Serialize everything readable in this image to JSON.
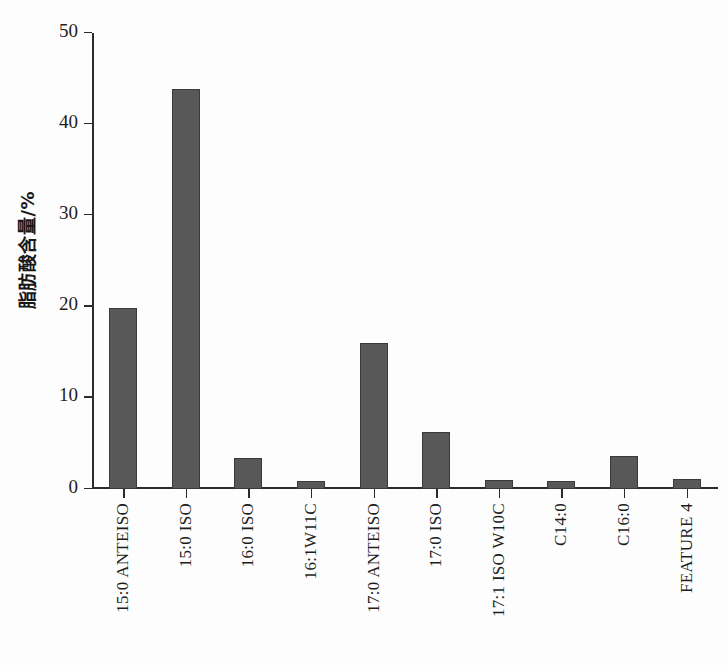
{
  "chart_data": {
    "type": "bar",
    "title": "",
    "subtitle": "",
    "xlabel": "",
    "ylabel": "脂肪酸含量/%",
    "ylim": [
      0,
      50
    ],
    "ytick_labels": [
      "50",
      "40",
      "30",
      "20",
      "10",
      "0"
    ],
    "ytick_values": [
      50,
      40,
      30,
      20,
      10,
      0
    ],
    "grid": false,
    "legend": false,
    "legend_position": "none",
    "bar_color": "#585858",
    "bar_edge_color": "#3a3a3a",
    "axis_color": "#2b2b2b",
    "background_color": "#fdfdfd",
    "categories": [
      "15:0 ANTEISO",
      "15:0 ISO",
      "16:0 ISO",
      "16:1W11C",
      "17:0 ANTEISO",
      "17:0 ISO",
      "17:1 ISO W10C",
      "C14:0",
      "C16:0",
      "FEATURE 4"
    ],
    "values": [
      19.8,
      43.9,
      3.4,
      0.9,
      16.0,
      6.2,
      1.0,
      0.9,
      3.6,
      1.1
    ]
  }
}
